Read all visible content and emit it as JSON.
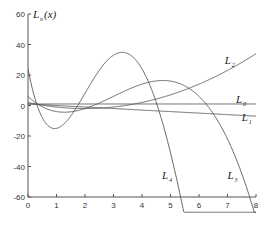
{
  "chart_data": {
    "type": "line",
    "title": "",
    "ylabel": "L_n(x)",
    "ylabel_main": "L",
    "ylabel_sub": "n",
    "ylabel_tail": "(x)",
    "xlabel": "",
    "xlim": [
      0,
      8
    ],
    "ylim": [
      -60,
      60
    ],
    "xticks": [
      0,
      1,
      2,
      3,
      4,
      5,
      6,
      7,
      8
    ],
    "yticks": [
      -60,
      -40,
      -20,
      0,
      20,
      40,
      60
    ],
    "grid": false,
    "legend": "none (inline curve labels)",
    "series": [
      {
        "name": "L0",
        "label_main": "L",
        "label_sub": "0",
        "formula": "1",
        "coeffs": [
          1
        ],
        "label_pos": [
          7.3,
          1.5
        ]
      },
      {
        "name": "L1",
        "label_main": "L",
        "label_sub": "1",
        "formula": "1 - x",
        "coeffs": [
          1,
          -1
        ],
        "label_pos": [
          7.5,
          -10
        ]
      },
      {
        "name": "L2",
        "label_main": "L",
        "label_sub": "2",
        "formula": "x^2 - 4x + 2",
        "coeffs": [
          2,
          -4,
          1
        ],
        "label_pos": [
          6.9,
          27
        ]
      },
      {
        "name": "L3",
        "label_main": "L",
        "label_sub": "3",
        "formula": "-x^3 + 9x^2 - 18x + 6",
        "coeffs": [
          6,
          -18,
          9,
          -1
        ],
        "label_pos": [
          7.0,
          -48
        ]
      },
      {
        "name": "L4",
        "label_main": "L",
        "label_sub": "4",
        "formula": "x^4 - 16x^3 + 72x^2 - 96x + 24",
        "coeffs": [
          24,
          -96,
          72,
          -16,
          1
        ],
        "label_pos": [
          4.7,
          -48
        ]
      }
    ],
    "sample_points": {
      "x": [
        0,
        1,
        2,
        3,
        4,
        5,
        6,
        7,
        8
      ],
      "L0": [
        1,
        1,
        1,
        1,
        1,
        1,
        1,
        1,
        1
      ],
      "L1": [
        1,
        0,
        -1,
        -2,
        -3,
        -4,
        -5,
        -6,
        -7
      ],
      "L2": [
        2,
        -1,
        -2,
        -1,
        2,
        7,
        14,
        23,
        34
      ],
      "L3": [
        6,
        -4,
        -2,
        6,
        14,
        16,
        6,
        -22,
        -74
      ],
      "L4": [
        24,
        -15,
        -8,
        33,
        24,
        -31,
        -120,
        -255,
        -424
      ]
    }
  },
  "colors": {
    "axis": "#555555",
    "curve": "#555555",
    "text": "#333333",
    "background": "#ffffff"
  }
}
